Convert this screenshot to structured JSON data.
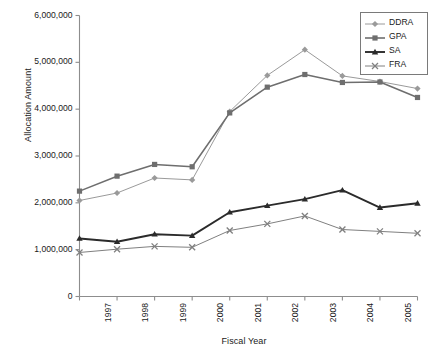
{
  "chart_data": {
    "type": "line",
    "title": "",
    "xlabel": "Fiscal Year",
    "ylabel": "Allocation Amount",
    "categories": [
      "1997",
      "1998",
      "1999",
      "2000",
      "2001",
      "2002",
      "2003",
      "2004",
      "2005",
      "2006"
    ],
    "ylim": [
      0,
      6000000
    ],
    "ytick_values": [
      0,
      1000000,
      2000000,
      3000000,
      4000000,
      5000000,
      6000000
    ],
    "ytick_labels": [
      "0",
      "1,000,000",
      "2,000,000",
      "3,000,000",
      "4,000,000",
      "5,000,000",
      "6,000,000"
    ],
    "grid": false,
    "legend_position": "top-right",
    "series": [
      {
        "name": "DDRA",
        "color": "#9a9a9a",
        "marker": "diamond",
        "values": [
          2050000,
          2210000,
          2530000,
          2490000,
          3950000,
          4720000,
          5270000,
          4710000,
          4590000,
          4440000
        ]
      },
      {
        "name": "GPA",
        "color": "#6e6e6e",
        "marker": "square",
        "values": [
          2250000,
          2570000,
          2820000,
          2770000,
          3920000,
          4470000,
          4740000,
          4570000,
          4580000,
          4250000
        ]
      },
      {
        "name": "SA",
        "color": "#2b2b2b",
        "marker": "triangle",
        "values": [
          1240000,
          1170000,
          1330000,
          1300000,
          1800000,
          1940000,
          2080000,
          2270000,
          1900000,
          1990000
        ]
      },
      {
        "name": "FRA",
        "color": "#808080",
        "marker": "cross",
        "values": [
          940000,
          1010000,
          1070000,
          1050000,
          1410000,
          1550000,
          1720000,
          1430000,
          1390000,
          1350000
        ]
      }
    ]
  },
  "legend": {
    "items": [
      {
        "label": "DDRA"
      },
      {
        "label": "GPA"
      },
      {
        "label": "SA"
      },
      {
        "label": "FRA"
      }
    ]
  }
}
